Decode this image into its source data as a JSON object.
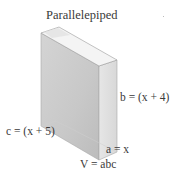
{
  "diagram": {
    "title": "Parallelepiped",
    "labels": {
      "b": "b = (x + 4)",
      "c": "c = (x + 5)",
      "a": "a = x",
      "volume": "V = abc"
    },
    "colors": {
      "front_face": "#c9c9c9",
      "side_face": "#dedede",
      "top_face": "#f2f2f2",
      "edge": "#9a9a9a"
    }
  }
}
